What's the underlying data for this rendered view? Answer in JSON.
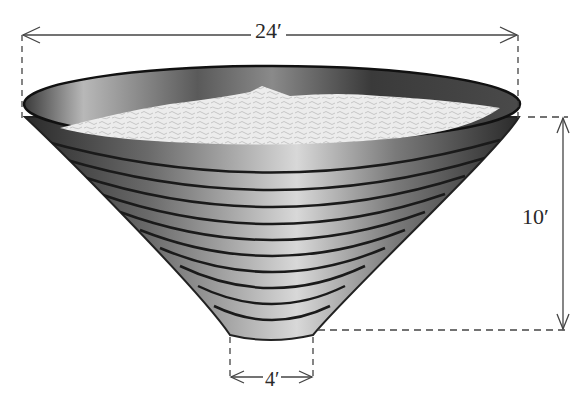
{
  "figure": {
    "dimensions": {
      "top_diameter": "24′",
      "height": "10′",
      "bottom_diameter": "4′"
    },
    "colors": {
      "bowl_dark": "#2e2e2e",
      "bowl_light": "#c8c8c8",
      "fill": "#e6e6e6",
      "lines": "#3a3a3a"
    },
    "ridge_count": 10
  }
}
